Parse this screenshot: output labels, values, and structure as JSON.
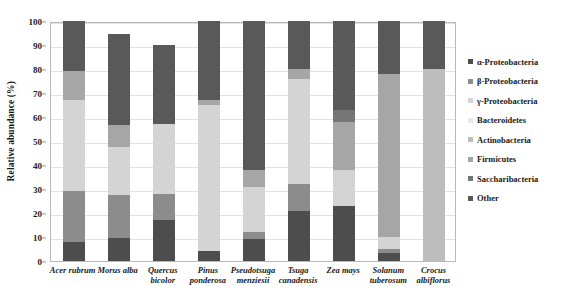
{
  "chart_data": {
    "type": "bar",
    "subtype": "stacked-bar-100",
    "title": "",
    "xlabel": "",
    "ylabel": "Relative abundance (%)",
    "ylim": [
      0,
      100
    ],
    "yticks": [
      0,
      10,
      20,
      30,
      40,
      50,
      60,
      70,
      80,
      90,
      100
    ],
    "grid": true,
    "legend_position": "right",
    "categories": [
      "Acer rubrum",
      "Morus alba",
      "Quercus bicolor",
      "Pinus ponderosa",
      "Pseudotsuga menziesii",
      "Tsuga canadensis",
      "Zea mays",
      "Solanum tuberosum",
      "Crocus albiflorus"
    ],
    "category_lines": [
      [
        "Acer rubrum"
      ],
      [
        "Morus alba"
      ],
      [
        "Quercus",
        "bicolor"
      ],
      [
        "Pinus",
        "ponderosa"
      ],
      [
        "Pseudotsuga",
        "menziesii"
      ],
      [
        "Tsuga",
        "canadensis"
      ],
      [
        "Zea mays"
      ],
      [
        "Solanum",
        "tuberosum"
      ],
      [
        "Crocus",
        "albiflorus"
      ]
    ],
    "series": [
      {
        "name": "α-Proteobacteria",
        "color": "#4d4d4d",
        "values": [
          8.0,
          9.5,
          17.0,
          4.0,
          9.0,
          21.0,
          23.0,
          3.5,
          0.0
        ]
      },
      {
        "name": "β-Proteobacteria",
        "color": "#8c8c8c",
        "values": [
          21.0,
          18.0,
          11.0,
          0.0,
          3.0,
          11.0,
          0.0,
          1.5,
          0.0
        ]
      },
      {
        "name": "γ-Proteobacteria",
        "color": "#d4d4d4",
        "values": [
          38.0,
          20.0,
          29.0,
          61.0,
          19.0,
          44.0,
          15.0,
          5.0,
          0.0
        ]
      },
      {
        "name": "Bacteroidetes",
        "color": "#e8e8e8",
        "values": [
          0.0,
          0.0,
          0.0,
          0.0,
          0.0,
          0.0,
          0.0,
          0.0,
          0.0
        ]
      },
      {
        "name": "Actinobacteria",
        "color": "#bdbdbd",
        "values": [
          0.0,
          0.0,
          0.0,
          0.0,
          0.0,
          0.0,
          0.0,
          0.0,
          80.0
        ]
      },
      {
        "name": "Firmicutes",
        "color": "#a6a6a6",
        "values": [
          12.0,
          9.0,
          0.0,
          2.0,
          7.0,
          4.0,
          20.0,
          68.0,
          0.0
        ]
      },
      {
        "name": "Saccharibacteria",
        "color": "#767676",
        "values": [
          0.0,
          0.0,
          0.0,
          0.0,
          0.0,
          0.0,
          5.0,
          0.0,
          0.0
        ]
      },
      {
        "name": "Other",
        "color": "#595959",
        "values": [
          21.0,
          38.0,
          33.0,
          33.0,
          62.0,
          20.0,
          37.0,
          22.0,
          20.0
        ]
      }
    ],
    "bar_totals": [
      100.0,
      94.5,
      90.0,
      100.0,
      100.0,
      100.0,
      100.0,
      100.0,
      100.0
    ]
  },
  "legend": {
    "items": [
      {
        "label": "α-Proteobacteria",
        "color": "#4d4d4d"
      },
      {
        "label": "β-Proteobacteria",
        "color": "#8c8c8c"
      },
      {
        "label": "γ-Proteobacteria",
        "color": "#d4d4d4"
      },
      {
        "label": "Bacteroidetes",
        "color": "#e8e8e8"
      },
      {
        "label": "Actinobacteria",
        "color": "#bdbdbd"
      },
      {
        "label": "Firmicutes",
        "color": "#a6a6a6"
      },
      {
        "label": "Saccharibacteria",
        "color": "#767676"
      },
      {
        "label": "Other",
        "color": "#595959"
      }
    ]
  }
}
